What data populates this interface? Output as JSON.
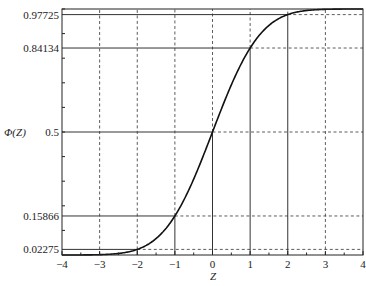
{
  "chart_data": {
    "type": "line",
    "title": "",
    "xlabel": "Z",
    "ylabel": "Φ(Z)",
    "xlim": [
      -4,
      4
    ],
    "ylim": [
      0,
      1
    ],
    "x_ticks": [
      -4,
      -3,
      -2,
      -1,
      0,
      1,
      2,
      3,
      4
    ],
    "x_tick_labels": [
      "−4",
      "−3",
      "−2",
      "−1",
      "0",
      "1",
      "2",
      "3",
      "4"
    ],
    "y_ticks": [
      0.02275,
      0.15866,
      0.5,
      0.84134,
      0.97725
    ],
    "y_tick_labels": [
      "0.02275",
      "0.15866",
      "0.5",
      "0.84134",
      "0.97725"
    ],
    "grid": true,
    "legend": null,
    "series": [
      {
        "name": "Standard normal CDF Φ(Z)",
        "x": [
          -4,
          -3,
          -2.5,
          -2,
          -1.5,
          -1,
          -0.5,
          0,
          0.5,
          1,
          1.5,
          2,
          2.5,
          3,
          4
        ],
        "values": [
          3e-05,
          0.00135,
          0.00621,
          0.02275,
          0.06681,
          0.15866,
          0.30854,
          0.5,
          0.69146,
          0.84134,
          0.93319,
          0.97725,
          0.99379,
          0.99865,
          0.99997
        ]
      }
    ],
    "reference_points": [
      {
        "x": -2,
        "y": 0.02275
      },
      {
        "x": -1,
        "y": 0.15866
      },
      {
        "x": 0,
        "y": 0.5
      },
      {
        "x": 1,
        "y": 0.84134
      },
      {
        "x": 2,
        "y": 0.97725
      }
    ]
  },
  "layout": {
    "plot_left": 62,
    "plot_right": 363,
    "plot_top": 9,
    "plot_bottom": 255,
    "line_color": "#111111",
    "grid_color": "#333333"
  }
}
